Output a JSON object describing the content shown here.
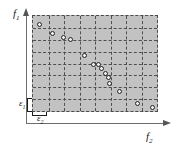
{
  "figure": {
    "type": "scatter",
    "background_color": "#ffffff",
    "plot_fill_color": "#c2c2c2",
    "grid_line_color": "#4f4f4f",
    "point_edge_color": "#242424",
    "point_fill_color": "#efefef",
    "axis_color": "#6d6d6d"
  },
  "axes": {
    "y_label": "f",
    "y_label_sub": "1",
    "x_label": "f",
    "x_label_sub": "2",
    "y_arrow_icon": "arrow-up-icon",
    "x_arrow_icon": "arrow-right-icon"
  },
  "grid_annotations": {
    "epsilon1_label": "ε",
    "epsilon1_sub": "1",
    "epsilon2_label": "ε",
    "epsilon2_sub": "2"
  },
  "chart_data": {
    "type": "scatter",
    "title": "",
    "subtitle": "",
    "xlabel": "f2",
    "ylabel": "f1",
    "xlim": [
      0,
      8
    ],
    "ylim": [
      0,
      8
    ],
    "grid": true,
    "grid_style": "dashed",
    "grid_divisions_x": 8,
    "grid_divisions_y": 8,
    "legend": null,
    "annotations": [
      {
        "text": "ε1",
        "role": "grid-cell-height",
        "position": "left-lower"
      },
      {
        "text": "ε2",
        "role": "grid-cell-width",
        "position": "bottom-left"
      }
    ],
    "series": [
      {
        "name": "pareto-front-points",
        "marker": "open-circle",
        "points": [
          {
            "x": 0.45,
            "y": 7.3
          },
          {
            "x": 1.25,
            "y": 6.55
          },
          {
            "x": 1.95,
            "y": 6.15
          },
          {
            "x": 2.45,
            "y": 6.0
          },
          {
            "x": 3.3,
            "y": 4.7
          },
          {
            "x": 3.9,
            "y": 3.95
          },
          {
            "x": 4.2,
            "y": 3.9
          },
          {
            "x": 4.45,
            "y": 3.55
          },
          {
            "x": 4.7,
            "y": 3.15
          },
          {
            "x": 4.85,
            "y": 2.85
          },
          {
            "x": 4.95,
            "y": 2.35
          },
          {
            "x": 5.55,
            "y": 1.65
          },
          {
            "x": 6.75,
            "y": 0.6
          },
          {
            "x": 7.7,
            "y": 0.3
          }
        ]
      }
    ]
  }
}
